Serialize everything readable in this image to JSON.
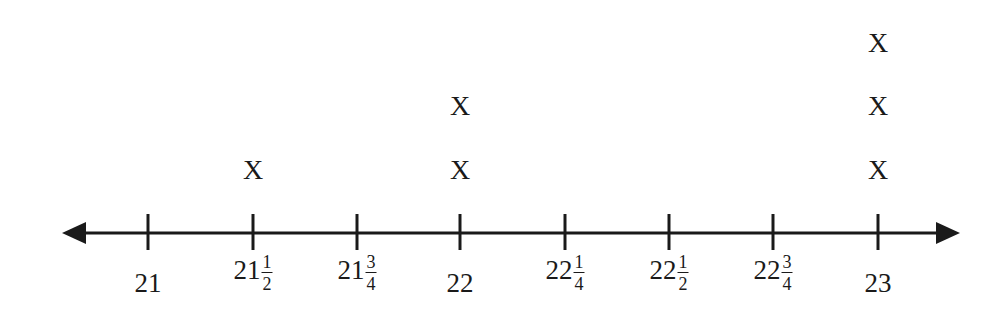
{
  "chart_data": {
    "type": "scatter",
    "subtype": "line-plot (dot plot with X marks)",
    "title": "",
    "xlabel": "",
    "ylabel": "",
    "marker": "X",
    "ticks": [
      {
        "value": 21,
        "whole": "21",
        "num": "",
        "den": ""
      },
      {
        "value": 21.5,
        "whole": "21",
        "num": "1",
        "den": "2"
      },
      {
        "value": 21.75,
        "whole": "21",
        "num": "3",
        "den": "4"
      },
      {
        "value": 22,
        "whole": "22",
        "num": "",
        "den": ""
      },
      {
        "value": 22.25,
        "whole": "22",
        "num": "1",
        "den": "4"
      },
      {
        "value": 22.5,
        "whole": "22",
        "num": "1",
        "den": "2"
      },
      {
        "value": 22.75,
        "whole": "22",
        "num": "3",
        "den": "4"
      },
      {
        "value": 23,
        "whole": "23",
        "num": "",
        "den": ""
      }
    ],
    "categories": [
      "21",
      "21 1/2",
      "21 3/4",
      "22",
      "22 1/4",
      "22 1/2",
      "22 3/4",
      "23"
    ],
    "values": [
      0,
      1,
      0,
      2,
      0,
      0,
      0,
      3
    ],
    "axis": {
      "arrows": "both",
      "grid": false
    }
  }
}
